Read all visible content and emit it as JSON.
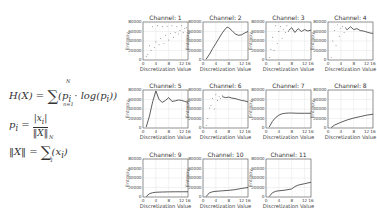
{
  "equations": {
    "entropy": {
      "lhs": "H(X) = ",
      "sum_upper": "N",
      "sum_lower": "n=1",
      "body": "(p",
      "sub": "i",
      "mid": " · log(p",
      "sub2": "i",
      "end": "))"
    },
    "prob": {
      "lhs": "p",
      "sub": "i",
      "eq": " = ",
      "num": "|x",
      "num_sub": "i",
      "num_end": "|",
      "den": "‖X‖"
    },
    "norm": {
      "lhs": "‖X‖ = ",
      "sum_upper": "N",
      "sum_lower": "1",
      "body": "(x",
      "sub": "i",
      "end": ")"
    }
  },
  "chart_data": {
    "type": "line",
    "xlabel": "Discretization Value",
    "ylabel": "Entropy",
    "xlim": [
      0,
      14
    ],
    "ylim": [
      0,
      80000
    ],
    "xticks": [
      0,
      4,
      8,
      12,
      16
    ],
    "xtick_labels": [
      "0",
      "4",
      "8",
      "12",
      "16"
    ],
    "yticks": [
      0,
      20000,
      40000,
      60000,
      80000
    ],
    "ytick_labels": [
      "0",
      "20000",
      "40000",
      "60000",
      "80000"
    ],
    "grid": true,
    "panels": [
      {
        "title": "Channel: 1",
        "style": "scatter",
        "x": [
          1,
          1.5,
          2,
          2.5,
          3,
          3.5,
          4,
          4.5,
          5,
          5.5,
          6,
          6.5,
          7,
          7.5,
          8,
          8.5,
          9,
          9.5,
          10,
          10.5,
          11,
          11.5,
          12,
          12.5,
          13,
          13.5,
          14
        ],
        "y": [
          8000,
          12000,
          30000,
          20000,
          70000,
          26000,
          38000,
          72000,
          32000,
          45000,
          70000,
          35000,
          52000,
          71000,
          42000,
          56000,
          72000,
          48000,
          58000,
          70000,
          55000,
          62000,
          72000,
          58000,
          66000,
          68000,
          62000
        ]
      },
      {
        "title": "Channel: 2",
        "style": "line",
        "x": [
          1,
          2,
          3,
          4,
          5,
          6,
          7,
          7.5,
          8,
          9,
          10,
          11,
          12,
          13,
          14
        ],
        "y": [
          2000,
          12000,
          24000,
          35000,
          46000,
          57000,
          66000,
          69000,
          68000,
          62000,
          55000,
          52000,
          53000,
          57000,
          60000
        ]
      },
      {
        "title": "Channel: 3",
        "style": "mixed",
        "scatter_x": [
          1,
          1.5,
          2,
          2.5,
          3,
          3.5,
          4,
          4.5,
          5,
          5.5,
          6,
          6.5,
          7
        ],
        "scatter_y": [
          5000,
          22000,
          48000,
          20000,
          72000,
          35000,
          60000,
          70000,
          45000,
          65000,
          58000,
          72000,
          60000
        ],
        "x": [
          7,
          8,
          9,
          10,
          11,
          12,
          13,
          14
        ],
        "y": [
          62000,
          68000,
          58000,
          66000,
          60000,
          64000,
          61000,
          63000
        ]
      },
      {
        "title": "Channel: 4",
        "style": "mixed",
        "scatter_x": [
          1,
          1.5,
          2,
          2.5,
          3,
          3.5,
          4,
          4.5,
          5,
          5.5
        ],
        "scatter_y": [
          5000,
          40000,
          62000,
          30000,
          74000,
          50000,
          66000,
          70000,
          58000,
          68000
        ],
        "x": [
          5.5,
          6,
          7,
          8,
          9,
          10,
          11,
          12,
          13,
          14
        ],
        "y": [
          66000,
          64000,
          70000,
          64000,
          66000,
          62000,
          61000,
          59000,
          57000,
          56000
        ]
      },
      {
        "title": "Channel: 5",
        "style": "line",
        "x": [
          1,
          2,
          3,
          4,
          5,
          6,
          7,
          8,
          9,
          10,
          11,
          12,
          13,
          14
        ],
        "y": [
          2000,
          25000,
          55000,
          78000,
          60000,
          54000,
          58000,
          64000,
          56000,
          57000,
          59000,
          58000,
          56000,
          54000
        ]
      },
      {
        "title": "Channel: 6",
        "style": "mixed",
        "scatter_x": [
          1,
          1.5,
          2,
          2.5,
          3,
          3.5,
          4,
          4.5,
          5,
          5.5,
          6
        ],
        "scatter_y": [
          5000,
          20000,
          42000,
          48000,
          62000,
          40000,
          70000,
          58000,
          66000,
          62000,
          68000
        ],
        "x": [
          6,
          7,
          8,
          9,
          10,
          11,
          12,
          13,
          14
        ],
        "y": [
          66000,
          64000,
          65000,
          63000,
          62000,
          60000,
          58000,
          57000,
          55000
        ]
      },
      {
        "title": "Channel: 7",
        "style": "line",
        "x": [
          1,
          2,
          3,
          4,
          5,
          6,
          7,
          8,
          10,
          12,
          14
        ],
        "y": [
          2000,
          14000,
          22000,
          27000,
          30000,
          31000,
          31500,
          31500,
          31000,
          31000,
          31000
        ]
      },
      {
        "title": "Channel: 8",
        "style": "line",
        "x": [
          1,
          2,
          4,
          6,
          8,
          10,
          12,
          14
        ],
        "y": [
          1000,
          6000,
          12000,
          17000,
          21000,
          24000,
          27000,
          29000
        ]
      },
      {
        "title": "Channel: 9",
        "style": "line",
        "x": [
          1,
          2,
          3,
          4,
          6,
          8,
          10,
          12,
          14
        ],
        "y": [
          1000,
          7000,
          9000,
          10000,
          10500,
          10800,
          11000,
          11000,
          11000
        ]
      },
      {
        "title": "Channel: 10",
        "style": "line",
        "x": [
          1,
          2,
          3,
          4,
          6,
          8,
          10,
          12,
          14
        ],
        "y": [
          1000,
          9000,
          11000,
          12000,
          13000,
          14000,
          15500,
          18000,
          20000
        ]
      },
      {
        "title": "Channel: 11",
        "style": "line",
        "x": [
          1,
          2,
          3,
          4,
          6,
          8,
          9,
          10,
          12,
          14
        ],
        "y": [
          1000,
          9000,
          12000,
          13000,
          14500,
          17000,
          22000,
          25000,
          28000,
          31000
        ]
      }
    ]
  }
}
